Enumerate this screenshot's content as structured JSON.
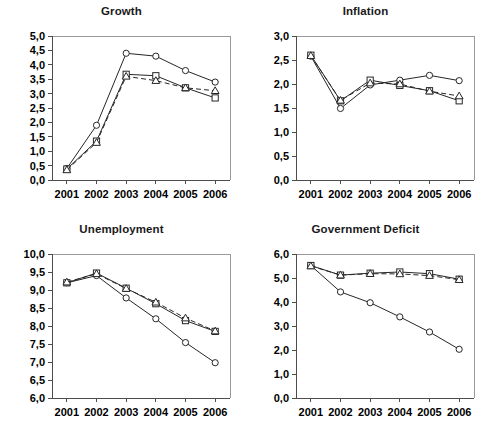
{
  "figure": {
    "background": "#ffffff",
    "ink": "#262626",
    "axis_color": "#4d4d4d",
    "frame_color": "#9a9a9a",
    "decimal_separator": ","
  },
  "chart_data": [
    {
      "type": "line",
      "id": "growth",
      "title": "Growth",
      "xlabel": "",
      "ylabel": "",
      "x": [
        "2001",
        "2002",
        "2003",
        "2004",
        "2005",
        "2006"
      ],
      "ylim": [
        0.0,
        5.0
      ],
      "yticks": [
        0.0,
        0.5,
        1.0,
        1.5,
        2.0,
        2.5,
        3.0,
        3.5,
        4.0,
        4.5,
        5.0
      ],
      "ytick_labels": [
        "0,0",
        "0,5",
        "1,0",
        "1,5",
        "2,0",
        "2,5",
        "3,0",
        "3,5",
        "4,0",
        "4,5",
        "5,0"
      ],
      "xtick_labels": [
        "2001",
        "2002",
        "2003",
        "2004",
        "2005",
        "2006"
      ],
      "grid": false,
      "legend": "none",
      "series": [
        {
          "name": "series-circle",
          "marker": "circle",
          "linestyle": "solid",
          "values": [
            0.4,
            1.9,
            4.4,
            4.3,
            3.8,
            3.4
          ]
        },
        {
          "name": "series-square",
          "marker": "square",
          "linestyle": "solid",
          "values": [
            0.38,
            1.35,
            3.67,
            3.62,
            3.2,
            2.85
          ]
        },
        {
          "name": "series-triangle",
          "marker": "triangle",
          "linestyle": "dashed",
          "values": [
            0.35,
            1.3,
            3.6,
            3.45,
            3.2,
            3.1
          ]
        }
      ]
    },
    {
      "type": "line",
      "id": "inflation",
      "title": "Inflation",
      "xlabel": "",
      "ylabel": "",
      "x": [
        "2001",
        "2002",
        "2003",
        "2004",
        "2005",
        "2006"
      ],
      "ylim": [
        0.0,
        3.0
      ],
      "yticks": [
        0.0,
        0.5,
        1.0,
        1.5,
        2.0,
        2.5,
        3.0
      ],
      "ytick_labels": [
        "0,0",
        "0,5",
        "1,0",
        "1,5",
        "2,0",
        "2,5",
        "3,0"
      ],
      "xtick_labels": [
        "2001",
        "2002",
        "2003",
        "2004",
        "2005",
        "2006"
      ],
      "grid": false,
      "legend": "none",
      "series": [
        {
          "name": "series-circle",
          "marker": "circle",
          "linestyle": "solid",
          "values": [
            2.58,
            1.49,
            1.98,
            2.08,
            2.18,
            2.07
          ]
        },
        {
          "name": "series-square",
          "marker": "square",
          "linestyle": "solid",
          "values": [
            2.6,
            1.65,
            2.08,
            1.97,
            1.86,
            1.65
          ]
        },
        {
          "name": "series-triangle",
          "marker": "triangle",
          "linestyle": "dashed",
          "values": [
            2.59,
            1.66,
            2.02,
            2.0,
            1.85,
            1.75
          ]
        }
      ]
    },
    {
      "type": "line",
      "id": "unemployment",
      "title": "Unemployment",
      "xlabel": "",
      "ylabel": "",
      "x": [
        "2001",
        "2002",
        "2003",
        "2004",
        "2005",
        "2006"
      ],
      "ylim": [
        6.0,
        10.0
      ],
      "yticks": [
        6.0,
        6.5,
        7.0,
        7.5,
        8.0,
        8.5,
        9.0,
        9.5,
        10.0
      ],
      "ytick_labels": [
        "6,0",
        "6,5",
        "7,0",
        "7,5",
        "8,0",
        "8,5",
        "9,0",
        "9,5",
        "10,0"
      ],
      "xtick_labels": [
        "2001",
        "2002",
        "2003",
        "2004",
        "2005",
        "2006"
      ],
      "grid": false,
      "legend": "none",
      "series": [
        {
          "name": "series-circle",
          "marker": "circle",
          "linestyle": "solid",
          "values": [
            9.2,
            9.4,
            8.78,
            8.2,
            7.54,
            6.98
          ]
        },
        {
          "name": "series-square",
          "marker": "square",
          "linestyle": "solid",
          "values": [
            9.2,
            9.47,
            9.05,
            8.62,
            8.15,
            7.85
          ]
        },
        {
          "name": "series-triangle",
          "marker": "triangle",
          "linestyle": "dashed",
          "values": [
            9.22,
            9.45,
            9.04,
            8.66,
            8.22,
            7.86
          ]
        }
      ]
    },
    {
      "type": "line",
      "id": "government-deficit",
      "title": "Government Deficit",
      "xlabel": "",
      "ylabel": "",
      "x": [
        "2001",
        "2002",
        "2003",
        "2004",
        "2005",
        "2006"
      ],
      "ylim": [
        0.0,
        6.0
      ],
      "yticks": [
        0.0,
        1.0,
        2.0,
        3.0,
        4.0,
        5.0,
        6.0
      ],
      "ytick_labels": [
        "0,0",
        "1,0",
        "2,0",
        "3,0",
        "4,0",
        "5,0",
        "6,0"
      ],
      "xtick_labels": [
        "2001",
        "2002",
        "2003",
        "2004",
        "2005",
        "2006"
      ],
      "grid": false,
      "legend": "none",
      "series": [
        {
          "name": "series-circle",
          "marker": "circle",
          "linestyle": "solid",
          "values": [
            5.52,
            4.42,
            3.97,
            3.38,
            2.75,
            2.03
          ]
        },
        {
          "name": "series-square",
          "marker": "square",
          "linestyle": "solid",
          "values": [
            5.52,
            5.12,
            5.2,
            5.25,
            5.18,
            4.95
          ]
        },
        {
          "name": "series-triangle",
          "marker": "triangle",
          "linestyle": "dashed",
          "values": [
            5.5,
            5.12,
            5.18,
            5.17,
            5.1,
            4.93
          ]
        }
      ]
    }
  ]
}
